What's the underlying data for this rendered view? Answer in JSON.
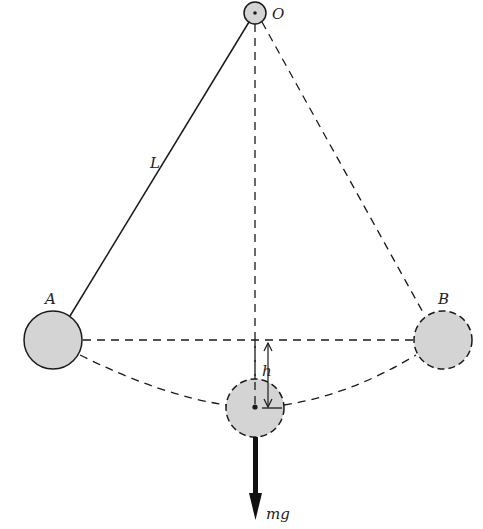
{
  "diagram": {
    "type": "simple pendulum energy diagram",
    "labels": {
      "pivot": "O",
      "length": "L",
      "left_position": "A",
      "right_position": "B",
      "height": "h",
      "force": "mg"
    },
    "colors": {
      "bob_fill": "#d4d4d4",
      "line": "#1a1a1a",
      "background": "#ffffff"
    },
    "geometry": {
      "pivot": {
        "x": 255,
        "y": 13,
        "r": 11
      },
      "bob_A": {
        "x": 53,
        "y": 340,
        "r": 29
      },
      "bob_B": {
        "x": 443,
        "y": 340,
        "r": 29
      },
      "bob_bottom": {
        "x": 255,
        "y": 408,
        "r": 29
      },
      "force_arrow_end_y": 520
    }
  }
}
